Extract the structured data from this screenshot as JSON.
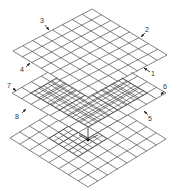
{
  "diagram": {
    "title": "",
    "line_color": "#4a4a4a",
    "background": "#ffffff",
    "planes": [
      {
        "name": "top-plane",
        "corners": {
          "top": [
            92,
            9
          ],
          "right": [
            167,
            52
          ],
          "bottom": [
            88,
            97
          ],
          "left": [
            13,
            51
          ]
        },
        "divisions": 8,
        "fine_grid": null
      },
      {
        "name": "middle-plane",
        "corners": {
          "top": [
            90,
            48
          ],
          "right": [
            166,
            92
          ],
          "bottom": [
            88,
            138
          ],
          "left": [
            12,
            93
          ]
        },
        "divisions": 8,
        "fine_grid": {
          "u": [
            0.12,
            0.88
          ],
          "v": [
            0.12,
            0.88
          ],
          "divisions": 14
        }
      },
      {
        "name": "bottom-plane",
        "corners": {
          "top": [
            88,
            90
          ],
          "right": [
            166,
            138
          ],
          "bottom": [
            88,
            187
          ],
          "left": [
            10,
            138
          ]
        },
        "divisions": 8,
        "fine_grid": {
          "u": [
            0.25,
            0.62
          ],
          "v": [
            0.25,
            0.62
          ],
          "divisions": 6
        }
      }
    ],
    "callouts": [
      {
        "label": "1",
        "text_pos": [
          153,
          74
        ],
        "tip": [
          144,
          68
        ],
        "tail": [
          150,
          72
        ]
      },
      {
        "label": "2",
        "text_pos": [
          147,
          30
        ],
        "tip": [
          141,
          37
        ],
        "tail": [
          145,
          33
        ]
      },
      {
        "label": "3",
        "text_pos": [
          42,
          21
        ],
        "tip": [
          49,
          30
        ],
        "tail": [
          45,
          25
        ]
      },
      {
        "label": "4",
        "text_pos": [
          22,
          70
        ],
        "tip": [
          30,
          63
        ],
        "tail": [
          26,
          67
        ]
      },
      {
        "label": "5",
        "text_pos": [
          150,
          119
        ],
        "tip": [
          144,
          111
        ],
        "tail": [
          148,
          115
        ]
      },
      {
        "label": "6",
        "text_pos": [
          165,
          87
        ],
        "tip": [
          161,
          95
        ],
        "tail": [
          164,
          91
        ]
      },
      {
        "label": "7",
        "text_pos": [
          9,
          86
        ],
        "tip": [
          16,
          91
        ],
        "tail": [
          13,
          88
        ]
      },
      {
        "label": "8",
        "text_pos": [
          17,
          117
        ],
        "tip": [
          26,
          109
        ],
        "tail": [
          22,
          113
        ]
      }
    ],
    "axis_marker": {
      "origin": [
        88,
        140
      ],
      "up": [
        88,
        128
      ],
      "left": [
        79,
        135
      ],
      "right": [
        98,
        135
      ]
    }
  }
}
